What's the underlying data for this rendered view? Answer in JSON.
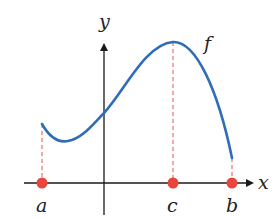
{
  "diagram": {
    "function_label": "f",
    "axes": {
      "x_label": "x",
      "y_label": "y"
    },
    "points": [
      {
        "label": "a",
        "role": "left-endpoint"
      },
      {
        "label": "c",
        "role": "maximum"
      },
      {
        "label": "b",
        "role": "right-endpoint"
      }
    ],
    "colors": {
      "curve": "#2f6db8",
      "points": "#e8463c",
      "dashed": "#e57368",
      "axes": "#1a1a1a"
    }
  }
}
